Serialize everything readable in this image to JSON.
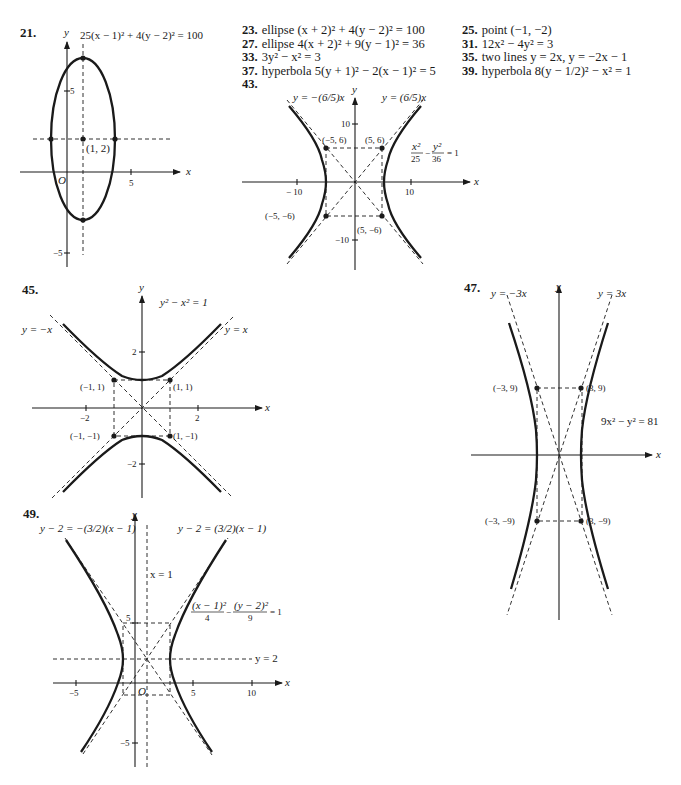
{
  "answers_col1": [
    {
      "num": "23.",
      "text": "ellipse (x + 2)² + 4(y − 2)² = 100"
    },
    {
      "num": "27.",
      "text": "ellipse 4(x + 2)² + 9(y − 1)² = 36"
    },
    {
      "num": "33.",
      "text": "3y² − x² = 3"
    },
    {
      "num": "37.",
      "text": "hyperbola 5(y + 1)² − 2(x − 1)² = 5"
    },
    {
      "num": "43.",
      "text": ""
    }
  ],
  "answers_col2": [
    {
      "num": "25.",
      "text": "point (−1, −2)"
    },
    {
      "num": "31.",
      "text": "12x² − 4y² = 3"
    },
    {
      "num": "35.",
      "text": "two lines y = 2x, y = −2x − 1"
    },
    {
      "num": "39.",
      "text": "hyperbola 8(y − 1/2)² − x² = 1"
    }
  ],
  "figures": {
    "fig21": {
      "label": "21.",
      "equation": "25(x − 1)² + 4(y − 2)² = 100",
      "axis_x": "x",
      "axis_y": "y",
      "origin": "O",
      "center_label": "(1, 2)",
      "ticks": {
        "x5": "5",
        "y5": "5",
        "yneg5": "−5"
      }
    },
    "fig43": {
      "label": "43.",
      "asym_left": "y = −(6/5)x",
      "asym_right": "y = (6/5)x",
      "equation": "x²/25 − y²/36 = 1",
      "eq_num1": "x²",
      "eq_den1": "25",
      "eq_num2": "y²",
      "eq_den2": "36",
      "eq_rhs": "= 1",
      "axis_x": "x",
      "axis_y": "y",
      "ticks": {
        "x10": "10",
        "xneg10": "− 10",
        "y10": "10",
        "yneg10": "−10"
      },
      "points": [
        "(−5, 6)",
        "(5, 6)",
        "(−5, −6)",
        "(5, −6)"
      ]
    },
    "fig45": {
      "label": "45.",
      "equation": "y² − x² = 1",
      "asym_left": "y = −x",
      "asym_right": "y = x",
      "axis_x": "x",
      "axis_y": "y",
      "ticks": {
        "x2": "2",
        "xneg2": "−2",
        "y2": "2",
        "yneg2": "−2"
      },
      "points": [
        "(−1, 1)",
        "(1, 1)",
        "(−1, −1)",
        "(1, −1)"
      ]
    },
    "fig47": {
      "label": "47.",
      "asym_left": "y = −3x",
      "asym_right": "y = 3x",
      "equation": "9x² − y² = 81",
      "axis_x": "x",
      "axis_y": "y",
      "points": [
        "(−3, 9)",
        "(3, 9)",
        "(−3, −9)",
        "(3, −9)"
      ]
    },
    "fig49": {
      "label": "49.",
      "asym_left": "y − 2 = −(3/2)(x − 1)",
      "asym_right": "y − 2 = (3/2)(x − 1)",
      "vline": "x = 1",
      "hline": "y = 2",
      "equation": "(x − 1)²/4 − (y − 2)²/9 = 1",
      "eq_num1": "(x − 1)²",
      "eq_den1": "4",
      "eq_num2": "(y − 2)²",
      "eq_den2": "9",
      "eq_rhs": "= 1",
      "axis_x": "x",
      "axis_y": "y",
      "origin": "O",
      "ticks": {
        "x5": "5",
        "x10": "10",
        "xneg5": "−5",
        "y5": "5",
        "yneg5": "−5"
      }
    }
  }
}
